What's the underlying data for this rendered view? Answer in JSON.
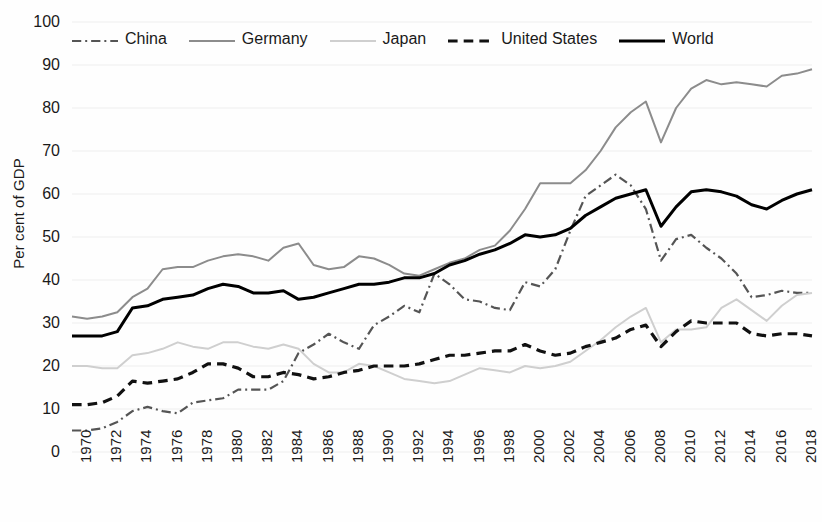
{
  "chart_data": {
    "type": "line",
    "title": "",
    "xlabel": "",
    "ylabel": "Per cent of GDP",
    "ylim": [
      0,
      100
    ],
    "ytick_step": 10,
    "xlim": [
      1970,
      2019
    ],
    "grid": true,
    "legend_position": "top",
    "ytick_labels": [
      "100",
      "90",
      "80",
      "70",
      "60",
      "50",
      "40",
      "30",
      "20",
      "10",
      "0"
    ],
    "xtick_labels": [
      "1970",
      "1972",
      "1974",
      "1976",
      "1978",
      "1980",
      "1982",
      "1984",
      "1986",
      "1988",
      "1990",
      "1992",
      "1994",
      "1996",
      "1998",
      "2000",
      "2002",
      "2004",
      "2006",
      "2008",
      "2010",
      "2012",
      "2014",
      "2016",
      "2018"
    ],
    "x": [
      1970,
      1971,
      1972,
      1973,
      1974,
      1975,
      1976,
      1977,
      1978,
      1979,
      1980,
      1981,
      1982,
      1983,
      1984,
      1985,
      1986,
      1987,
      1988,
      1989,
      1990,
      1991,
      1992,
      1993,
      1994,
      1995,
      1996,
      1997,
      1998,
      1999,
      2000,
      2001,
      2002,
      2003,
      2004,
      2005,
      2006,
      2007,
      2008,
      2009,
      2010,
      2011,
      2012,
      2013,
      2014,
      2015,
      2016,
      2017,
      2018,
      2019
    ],
    "series": [
      {
        "name": "China",
        "color": "#555555",
        "style": "dash-dot",
        "width": 2.2,
        "values": [
          5.0,
          5.0,
          5.5,
          7.0,
          9.5,
          10.5,
          9.5,
          9.0,
          11.5,
          12.0,
          12.5,
          14.5,
          14.5,
          14.5,
          16.5,
          23.0,
          25.0,
          27.5,
          25.5,
          24.0,
          29.5,
          31.5,
          34.0,
          32.5,
          41.5,
          39.0,
          35.5,
          35.0,
          33.5,
          33.0,
          39.5,
          38.5,
          42.5,
          51.5,
          59.5,
          62.0,
          64.5,
          62.0,
          56.5,
          44.5,
          49.5,
          50.5,
          47.5,
          45.0,
          41.5,
          36.0,
          36.5,
          37.5,
          37.0,
          37.0
        ]
      },
      {
        "name": "Germany",
        "color": "#8c8c8c",
        "style": "solid",
        "width": 2.0,
        "values": [
          31.5,
          31.0,
          31.5,
          32.5,
          36.0,
          38.0,
          42.5,
          43.0,
          43.0,
          44.5,
          45.5,
          46.0,
          45.5,
          44.5,
          47.5,
          48.5,
          43.5,
          42.5,
          43.0,
          45.5,
          45.0,
          43.5,
          41.5,
          41.0,
          42.5,
          44.0,
          45.0,
          47.0,
          48.0,
          51.5,
          56.5,
          62.5,
          62.5,
          62.5,
          65.5,
          70.0,
          75.5,
          79.0,
          81.5,
          72.0,
          80.0,
          84.5,
          86.5,
          85.5,
          86.0,
          85.5,
          85.0,
          87.5,
          88.0,
          89.0
        ]
      },
      {
        "name": "Japan",
        "color": "#cfcfcf",
        "style": "solid",
        "width": 2.0,
        "values": [
          20.0,
          20.0,
          19.5,
          19.5,
          22.5,
          23.0,
          24.0,
          25.5,
          24.5,
          24.0,
          25.5,
          25.5,
          24.5,
          24.0,
          25.0,
          24.0,
          20.5,
          18.5,
          18.5,
          20.5,
          20.0,
          18.5,
          17.0,
          16.5,
          16.0,
          16.5,
          18.0,
          19.5,
          19.0,
          18.5,
          20.0,
          19.5,
          20.0,
          21.0,
          23.5,
          26.0,
          29.0,
          31.5,
          33.5,
          25.5,
          28.5,
          28.5,
          29.0,
          33.5,
          35.5,
          33.0,
          30.5,
          34.0,
          36.5,
          37.0
        ]
      },
      {
        "name": "United States",
        "color": "#111111",
        "style": "dashed",
        "width": 3.2,
        "values": [
          11.0,
          11.0,
          11.5,
          13.0,
          16.5,
          16.0,
          16.5,
          17.0,
          18.5,
          20.5,
          20.5,
          19.5,
          17.5,
          17.5,
          18.5,
          18.0,
          17.0,
          17.5,
          18.5,
          19.0,
          20.0,
          20.0,
          20.0,
          20.5,
          21.5,
          22.5,
          22.5,
          23.0,
          23.5,
          23.5,
          25.0,
          23.5,
          22.5,
          23.0,
          24.5,
          25.5,
          26.5,
          28.5,
          29.5,
          24.5,
          28.0,
          30.5,
          30.0,
          30.0,
          30.0,
          27.5,
          27.0,
          27.5,
          27.5,
          27.0
        ]
      },
      {
        "name": "World",
        "color": "#000000",
        "style": "solid",
        "width": 3.0,
        "values": [
          27.0,
          27.0,
          27.0,
          28.0,
          33.5,
          34.0,
          35.5,
          36.0,
          36.5,
          38.0,
          39.0,
          38.5,
          37.0,
          37.0,
          37.5,
          35.5,
          36.0,
          37.0,
          38.0,
          39.0,
          39.0,
          39.5,
          40.5,
          40.5,
          41.5,
          43.5,
          44.5,
          46.0,
          47.0,
          48.5,
          50.5,
          50.0,
          50.5,
          52.0,
          55.0,
          57.0,
          59.0,
          60.0,
          61.0,
          52.5,
          57.0,
          60.5,
          61.0,
          60.5,
          59.5,
          57.5,
          56.5,
          58.5,
          60.0,
          61.0
        ]
      }
    ]
  },
  "legend": {
    "items": [
      {
        "label": "China",
        "swatch": "dash-dot-swatch"
      },
      {
        "label": "Germany",
        "swatch": "solid-gray-swatch"
      },
      {
        "label": "Japan",
        "swatch": "solid-lightgray-swatch"
      },
      {
        "label": "United States",
        "swatch": "dashed-bold-swatch"
      },
      {
        "label": "World",
        "swatch": "solid-black-swatch"
      }
    ]
  }
}
